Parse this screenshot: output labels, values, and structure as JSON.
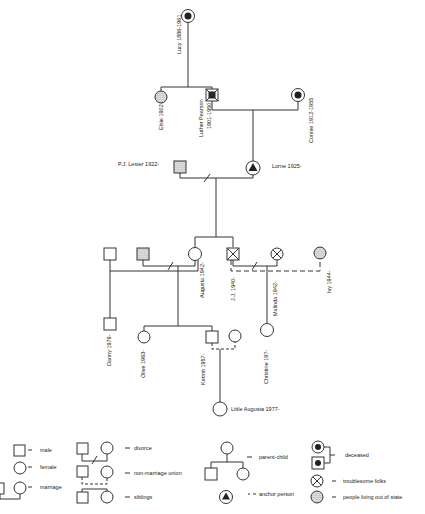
{
  "diagram": {
    "type": "genogram",
    "people": {
      "lucy": {
        "name": "Lucy 1886-1961",
        "sex": "female",
        "status": "deceased"
      },
      "elsie": {
        "name": "Elsie 1902-",
        "sex": "female",
        "status": "living out of state"
      },
      "luther": {
        "name": "Luther Pearson",
        "years": "1901-1950",
        "sex": "male",
        "status": "deceased, troublesome"
      },
      "connie": {
        "name": "Connie 1912-1955",
        "sex": "female",
        "status": "deceased"
      },
      "lester": {
        "name": "P.J. Lester 1922-",
        "sex": "male",
        "status": "living out of state"
      },
      "lorne": {
        "name": "Lorne 1925-",
        "sex": "female",
        "status": "anchor person"
      },
      "unnamed_male": {
        "name": "",
        "sex": "male"
      },
      "unnamed_dotted_male": {
        "name": "",
        "sex": "male",
        "status": "living out of state"
      },
      "augusta": {
        "name": "Augusta 1942-",
        "sex": "female"
      },
      "jj": {
        "name": "J.J. 1940-",
        "sex": "male",
        "status": "troublesome"
      },
      "malinda": {
        "name": "Malinda 1942-",
        "sex": "female",
        "status": "troublesome"
      },
      "ivy": {
        "name": "Ivy 1944-",
        "sex": "female",
        "status": "living out of state"
      },
      "danny": {
        "name": "Danny 1979-",
        "sex": "male"
      },
      "olive": {
        "name": "Olive 1963-",
        "sex": "female"
      },
      "kermit": {
        "name": "Kermit 1957-",
        "sex": "male"
      },
      "kermit_partner": {
        "name": "",
        "sex": "female"
      },
      "christine": {
        "name": "Christine 19?-",
        "sex": "female"
      },
      "little_augusta": {
        "name": "Little Augusta 1977-",
        "sex": "female"
      }
    },
    "legend": {
      "male": "male",
      "female": "female",
      "marriage": "marriage",
      "divorce": "divorce",
      "non_marriage_union": "non-marriage union",
      "siblings": "siblings",
      "parent_child": "parent-child",
      "anchor_person": "anchor person",
      "deceased": "deceased",
      "troublesome": "troublesome folks",
      "out_of_state": "people living out of state"
    }
  }
}
